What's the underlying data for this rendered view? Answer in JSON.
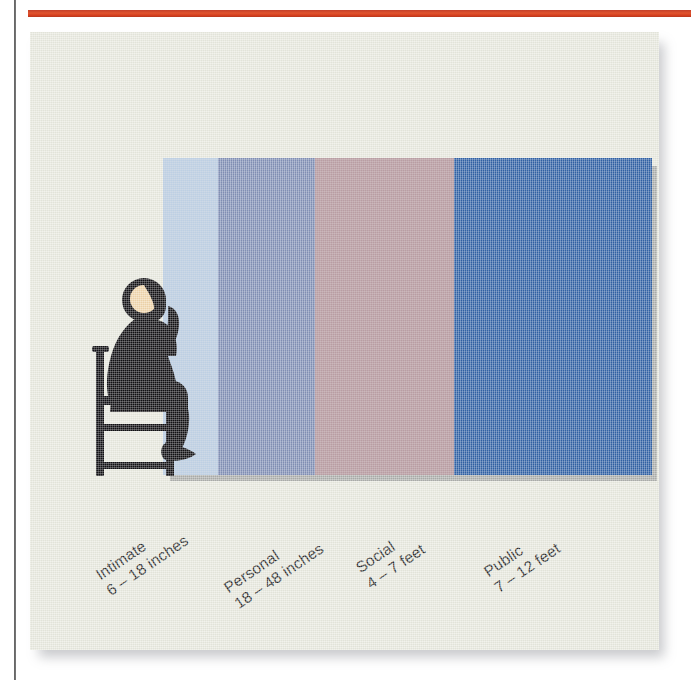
{
  "page": {
    "background_color": "#ffffff",
    "card_background_color": "#e9eae0",
    "top_rule_color": "#d6451f",
    "gutter_rule_color": "#2c2c2c"
  },
  "figure": {
    "body_color": "#111013",
    "face_color": "#f2d7ad",
    "chair_color": "#111013"
  },
  "chart_data": {
    "type": "bar",
    "title": "",
    "subtitle": "",
    "xlabel": "",
    "ylabel": "",
    "orientation": "horizontal-bands",
    "grid": false,
    "legend_position": "below-axis-rotated",
    "categories": [
      "Intimate",
      "Personal",
      "Social",
      "Public"
    ],
    "tick_labels": [
      "6 – 18 inches",
      "18 – 48 inches",
      "4 – 7 feet",
      "7 – 12 feet"
    ],
    "units": [
      "inches",
      "inches",
      "feet",
      "feet"
    ],
    "ranges": [
      {
        "min": 6,
        "max": 18,
        "unit": "inches"
      },
      {
        "min": 18,
        "max": 48,
        "unit": "inches"
      },
      {
        "min": 4,
        "max": 7,
        "unit": "feet"
      },
      {
        "min": 7,
        "max": 12,
        "unit": "feet"
      }
    ],
    "values": [
      55,
      97,
      139,
      198
    ],
    "colors": [
      "#b9cfe8",
      "#7b8cb8",
      "#b49199",
      "#1f57a5"
    ],
    "series": [
      {
        "name": "Distance zones",
        "values": [
          55,
          97,
          139,
          198
        ]
      }
    ]
  },
  "zones": [
    {
      "name": "Intimate",
      "range": "6 – 18 inches",
      "color": "#b9cfe8",
      "width_px": 55
    },
    {
      "name": "Personal",
      "range": "18 – 48 inches",
      "color": "#7b8cb8",
      "width_px": 97
    },
    {
      "name": "Social",
      "range": "4 – 7 feet",
      "color": "#b49199",
      "width_px": 139
    },
    {
      "name": "Public",
      "range": "7 – 12 feet",
      "color": "#1f57a5",
      "width_px": 198
    }
  ]
}
